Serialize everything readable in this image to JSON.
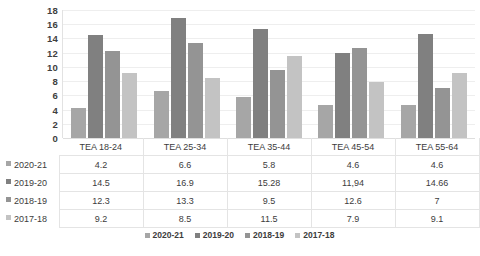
{
  "chart_data": {
    "type": "bar",
    "title": "",
    "xlabel": "",
    "ylabel": "",
    "ylim": [
      0,
      18
    ],
    "ytick_step": 2,
    "yticks": [
      "18",
      "16",
      "14",
      "12",
      "10",
      "8",
      "6",
      "4",
      "2",
      "0"
    ],
    "grid": true,
    "legend_position": "bottom",
    "categories": [
      "TEA 18-24",
      "TEA 25-34",
      "TEA 35-44",
      "TEA 45-54",
      "TEA 55-64"
    ],
    "series": [
      {
        "name": "2020-21",
        "color": "#a6a6a6",
        "values": [
          4.2,
          6.6,
          5.8,
          4.6,
          4.6
        ],
        "labels": [
          "4.2",
          "6.6",
          "5.8",
          "4.6",
          "4.6"
        ]
      },
      {
        "name": "2019-20",
        "color": "#808080",
        "values": [
          14.5,
          16.9,
          15.28,
          11.94,
          14.66
        ],
        "labels": [
          "14.5",
          "16.9",
          "15.28",
          "11,94",
          "14.66"
        ]
      },
      {
        "name": "2018-19",
        "color": "#949494",
        "values": [
          12.3,
          13.3,
          9.5,
          12.6,
          7
        ],
        "labels": [
          "12.3",
          "13.3",
          "9.5",
          "12.6",
          "7"
        ]
      },
      {
        "name": "2017-18",
        "color": "#c3c3c3",
        "values": [
          9.2,
          8.5,
          11.5,
          7.9,
          9.1
        ],
        "labels": [
          "9.2",
          "8.5",
          "11.5",
          "7.9",
          "9.1"
        ]
      }
    ]
  },
  "title_fragment": "",
  "legend": {
    "items": [
      {
        "label": "2020-21",
        "color": "#a6a6a6"
      },
      {
        "label": "2019-20",
        "color": "#808080"
      },
      {
        "label": "2018-19",
        "color": "#949494"
      },
      {
        "label": "2017-18",
        "color": "#c3c3c3"
      }
    ]
  },
  "data_table": {
    "corner": "",
    "column_headers": [
      "TEA 18-24",
      "TEA 25-34",
      "TEA 35-44",
      "TEA 45-54",
      "TEA 55-64"
    ],
    "rows": [
      {
        "label": "2020-21",
        "color": "#a6a6a6",
        "cells": [
          "4.2",
          "6.6",
          "5.8",
          "4.6",
          "4.6"
        ]
      },
      {
        "label": "2019-20",
        "color": "#808080",
        "cells": [
          "14.5",
          "16.9",
          "15.28",
          "11,94",
          "14.66"
        ]
      },
      {
        "label": "2018-19",
        "color": "#949494",
        "cells": [
          "12.3",
          "13.3",
          "9.5",
          "12.6",
          "7"
        ]
      },
      {
        "label": "2017-18",
        "color": "#c3c3c3",
        "cells": [
          "9.2",
          "8.5",
          "11.5",
          "7.9",
          "9.1"
        ]
      }
    ]
  }
}
